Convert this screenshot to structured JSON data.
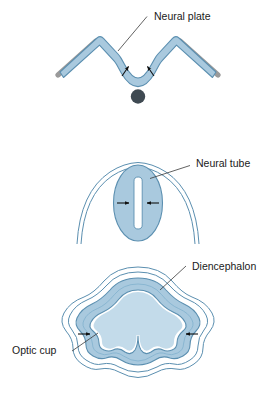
{
  "figure": {
    "background_color": "#ffffff",
    "width": 276,
    "height": 394
  },
  "palette": {
    "neural_fill": "#a9c9de",
    "neural_fill_light": "#c3dbea",
    "neural_stroke": "#5b8fb0",
    "thin_contour_stroke": "#5b8fb0",
    "epidermis_gray": "#9a9a9a",
    "notochord_dot": "#3f4a52",
    "arrow_color": "#111111",
    "leader_color": "#3a3a3a",
    "label_color": "#1a1a1a",
    "lumen_white": "#ffffff"
  },
  "panels": [
    {
      "id": "panel-neural-plate",
      "stage": 1,
      "label": "Neural plate",
      "label_x": 154,
      "label_y": 17,
      "features": [
        "w-shaped folding neural plate",
        "gray epidermal ectoderm flanks",
        "two convergence arrows",
        "notochord dot below midline"
      ]
    },
    {
      "id": "panel-neural-tube",
      "stage": 2,
      "label": "Neural tube",
      "label_x": 196,
      "label_y": 164,
      "features": [
        "closed oval neural tube",
        "white vertical lumen slit",
        "two inward arrows",
        "overlying epidermis double arc"
      ]
    },
    {
      "id": "panel-diencephalon",
      "stage": 3,
      "label_diencephalon": "Diencephalon",
      "label_diencephalon_x": 192,
      "label_diencephalon_y": 267,
      "label_optic_cup": "Optic cup",
      "label_optic_cup_x": 12,
      "label_optic_cup_y": 351,
      "features": [
        "expanded forebrain vesicle",
        "bilateral optic cup evaginations",
        "two inward arrows at optic stalks",
        "outer surface ectoderm contours"
      ]
    }
  ],
  "labels": {
    "neural_plate": "Neural plate",
    "neural_tube": "Neural tube",
    "diencephalon": "Diencephalon",
    "optic_cup": "Optic cup"
  },
  "caption": {
    "partial_text": "",
    "visible": false
  }
}
